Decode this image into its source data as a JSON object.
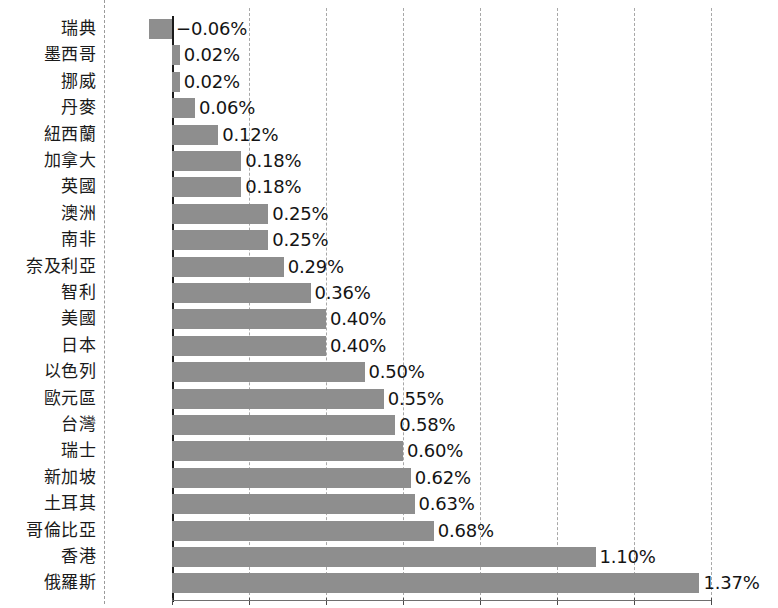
{
  "chart_data": {
    "type": "bar",
    "orientation": "horizontal",
    "title": "",
    "subtitle": "",
    "xlabel": "",
    "ylabel": "",
    "xlim": [
      -0.1,
      1.4
    ],
    "grid": true,
    "gridline_interval": 0.2,
    "legend": "none",
    "value_suffix": "%",
    "bar_color": "#8e8e8e",
    "axis_color": "#1a1a1a",
    "gridline_color": "#a8a8a8",
    "categories": [
      "瑞典",
      "墨西哥",
      "挪威",
      "丹麥",
      "紐西蘭",
      "加拿大",
      "英國",
      "澳洲",
      "南非",
      "奈及利亞",
      "智利",
      "美國",
      "日本",
      "以色列",
      "歐元區",
      "台灣",
      "瑞士",
      "新加坡",
      "土耳其",
      "哥倫比亞",
      "香港",
      "俄羅斯"
    ],
    "values": [
      -0.06,
      0.02,
      0.02,
      0.06,
      0.12,
      0.18,
      0.18,
      0.25,
      0.25,
      0.29,
      0.36,
      0.4,
      0.4,
      0.5,
      0.55,
      0.58,
      0.6,
      0.62,
      0.63,
      0.68,
      1.1,
      1.37
    ],
    "value_labels": [
      "-0.06%",
      "0.02%",
      "0.02%",
      "0.06%",
      "0.12%",
      "0.18%",
      "0.18%",
      "0.25%",
      "0.25%",
      "0.29%",
      "0.36%",
      "0.40%",
      "0.40%",
      "0.50%",
      "0.55%",
      "0.58%",
      "0.60%",
      "0.62%",
      "0.63%",
      "0.68%",
      "1.10%",
      "1.37%"
    ],
    "xticks": [
      0,
      0.2,
      0.4,
      0.6,
      0.8,
      1.0,
      1.2,
      1.4
    ],
    "xtick_labels": [
      "",
      "",
      "",
      "",
      "",
      "",
      "",
      ""
    ]
  },
  "layout": {
    "zero_x_px": 172,
    "px_per_percent": 385,
    "row_height_px": 26.4,
    "bar_height_px": 20,
    "top_offset_px": 19,
    "label_column_width_px": 104
  }
}
